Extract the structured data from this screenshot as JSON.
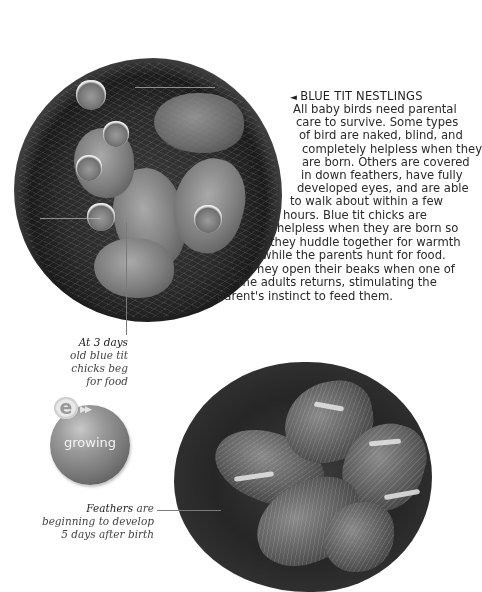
{
  "section": {
    "heading_arrow": "◄",
    "heading": "BLUE TIT NESTLINGS",
    "body_lines": [
      "All baby birds need parental",
      "care to survive. Some types",
      "of bird are naked, blind, and",
      "completely helpless when they",
      "are born. Others are covered",
      "in down feathers, have fully",
      "developed eyes, and are able",
      "to walk about within a few",
      "hours. Blue tit chicks are",
      "helpless when they are born so",
      "they huddle together for warmth",
      "while the parents hunt for food.",
      "They open their beaks when one of",
      "the adults returns, stimulating the",
      "parent's instinct to feed them."
    ]
  },
  "images": {
    "nest_3_days": {
      "subject": "blue tit nestlings with open beaks in nest",
      "caption_lead": "At 3 days",
      "caption_lines": [
        "old blue tit",
        "chicks beg",
        "for food"
      ]
    },
    "nest_5_days": {
      "subject": "feathered blue tit chicks huddled in nest",
      "caption_lead": "Feathers",
      "caption_lead_rest": " are",
      "caption_lines": [
        "beginning to develop",
        "5 days after birth"
      ]
    }
  },
  "badge": {
    "logo_letter": "e",
    "link_icon": "fast-forward-icon",
    "link_glyph": "▶▶",
    "label": "growing"
  }
}
